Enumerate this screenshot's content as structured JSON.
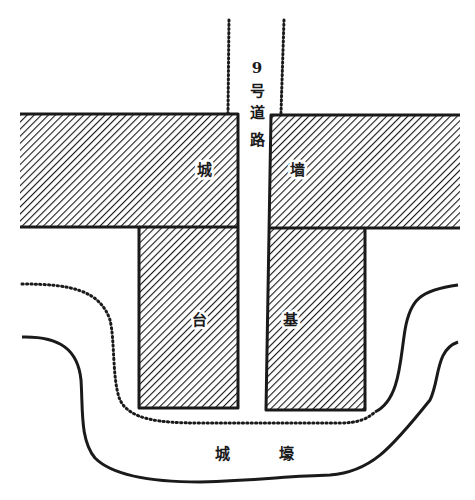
{
  "diagram": {
    "type": "archaeological site plan",
    "road": {
      "label_chars": [
        "9",
        "号",
        "道",
        "路"
      ],
      "label": "9号道路"
    },
    "wall_labels": {
      "left": "城",
      "right": "墙",
      "text": "城墙"
    },
    "base_labels": {
      "left": "台",
      "right": "基",
      "text": "台基"
    },
    "moat_labels": {
      "left": "城",
      "right": "壕",
      "text": "城壕"
    },
    "colors": {
      "ink": "#1a1a1a",
      "background": "#ffffff"
    },
    "legend_semantics": {
      "hatched": "rammed-earth structure (wall / platform)",
      "dotted": "road edge / platform edge boundary",
      "solid_curve": "moat edge"
    }
  }
}
